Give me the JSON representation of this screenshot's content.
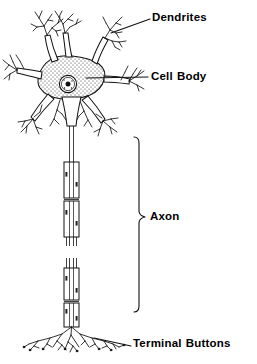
{
  "figure": {
    "kind": "anatomical-line-diagram",
    "width": 257,
    "height": 364,
    "background_color": "#FFFFFF",
    "ink_color": "#000000"
  },
  "labels": {
    "dendrites": "Dendrites",
    "cell_body_word1": "Cell",
    "cell_body_word2": "Body",
    "axon": "Axon",
    "terminal_word1": "Terminal",
    "terminal_word2": "Buttons"
  },
  "parts": [
    {
      "id": "dendrites",
      "label": "Dendrites",
      "leader": "diagonal-line from upper-right dendrite tip to label",
      "description": "branching tree-like processes radiating from the soma"
    },
    {
      "id": "cell-body",
      "label": "Cell Body",
      "leader": "horizontal line from soma to label",
      "description": "stippled polygonal soma containing a round nucleus with dark nucleolus"
    },
    {
      "id": "axon",
      "label": "Axon",
      "leader": "vertical brace spanning the myelinated fiber",
      "description": "long myelinated fiber with nodes of Ranvier, drawn in two interrupted segments"
    },
    {
      "id": "terminal-buttons",
      "label": "Terminal Buttons",
      "leader": "diagonal line from terminal arbor to label",
      "description": "fine branching endings at the axon terminus"
    }
  ]
}
